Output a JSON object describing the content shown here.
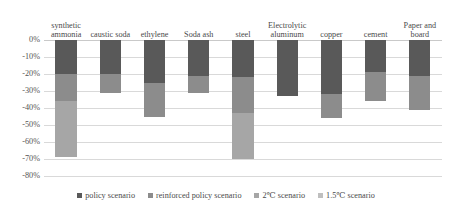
{
  "chart_data": {
    "type": "bar",
    "title": "",
    "xlabel": "",
    "ylabel": "",
    "ylim": [
      -80,
      0
    ],
    "grid": true,
    "stacked_cumulative": true,
    "legend_position": "bottom",
    "categories": [
      "synthetic ammonia",
      "caustic soda",
      "ethylene",
      "Soda ash",
      "steel",
      "Electrolytic aluminum",
      "copper",
      "cement",
      "Paper and board"
    ],
    "ytick_labels": [
      "0%",
      "-10%",
      "-20%",
      "-30%",
      "-40%",
      "-50%",
      "-60%",
      "-70%",
      "-80%"
    ],
    "ytick_values": [
      0,
      -10,
      -20,
      -30,
      -40,
      -50,
      -60,
      -70,
      -80
    ],
    "series": [
      {
        "name": "policy scenario",
        "color": "#595959",
        "values": [
          -20,
          -20,
          -25,
          -21,
          -22,
          -33,
          -32,
          -19,
          -21
        ]
      },
      {
        "name": "reinforced policy scenario",
        "color": "#8c8c8c",
        "values": [
          -36,
          -31,
          -45,
          -31,
          -43,
          -33,
          -46,
          -36,
          -41
        ]
      },
      {
        "name": "2℃ scenario",
        "color": "#a6a6a6",
        "values": [
          -69,
          -31,
          -45,
          -31,
          -70,
          -33,
          -46,
          -36,
          -41
        ]
      },
      {
        "name": "1.5℃ scenario",
        "color": "#bfbfbf",
        "values": [
          -69,
          -31,
          -45,
          -31,
          -70,
          -33,
          -46,
          -36,
          -41
        ]
      }
    ],
    "bar_segments": [
      {
        "category": "synthetic ammonia",
        "stops": [
          -20,
          -36,
          -69
        ]
      },
      {
        "category": "caustic soda",
        "stops": [
          -20,
          -31
        ]
      },
      {
        "category": "ethylene",
        "stops": [
          -25,
          -45
        ]
      },
      {
        "category": "Soda ash",
        "stops": [
          -21,
          -31
        ]
      },
      {
        "category": "steel",
        "stops": [
          -22,
          -43,
          -70
        ]
      },
      {
        "category": "Electrolytic aluminum",
        "stops": [
          -33
        ]
      },
      {
        "category": "copper",
        "stops": [
          -32,
          -46
        ]
      },
      {
        "category": "cement",
        "stops": [
          -19,
          -36
        ]
      },
      {
        "category": "Paper and board",
        "stops": [
          -21,
          -41
        ]
      }
    ]
  },
  "legend": {
    "items": [
      {
        "label": "policy scenario",
        "color": "#595959"
      },
      {
        "label": "reinforced policy scenario",
        "color": "#8c8c8c"
      },
      {
        "label": "2℃ scenario",
        "color": "#a6a6a6"
      },
      {
        "label": "1.5℃ scenario",
        "color": "#bfbfbf"
      }
    ]
  }
}
